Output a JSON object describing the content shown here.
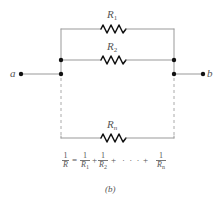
{
  "diagram": {
    "type": "parallel-resistor-circuit",
    "terminals": {
      "left": "a",
      "right": "b"
    },
    "resistors": [
      {
        "name": "R",
        "sub": "1"
      },
      {
        "name": "R",
        "sub": "2"
      },
      {
        "name": "R",
        "sub": "n"
      }
    ],
    "formula": {
      "lhs": {
        "num": "1",
        "den": "R"
      },
      "equals": "=",
      "terms": [
        {
          "num": "1",
          "den": "R",
          "sub": "1"
        },
        {
          "num": "1",
          "den": "R",
          "sub": "2"
        },
        {
          "num": "1",
          "den": "R",
          "sub": "n"
        }
      ],
      "plus": "+",
      "ellipsis": "· · ·"
    },
    "caption": "(b)",
    "colors": {
      "wire": "#888888",
      "dot": "#111111",
      "resistor": "#111111",
      "text": "#555555"
    }
  }
}
